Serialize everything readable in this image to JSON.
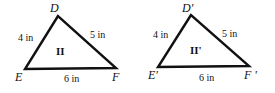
{
  "diagram": {
    "triangles": [
      {
        "id": "II",
        "label": "II",
        "vertices": {
          "D": "D",
          "E": "E",
          "F": "F"
        },
        "sides": {
          "DE": "4 in",
          "DF": "5 in",
          "EF": "6 in"
        }
      },
      {
        "id": "II'",
        "label": "II'",
        "vertices": {
          "D": "D'",
          "E": "E'",
          "F": "F '"
        },
        "sides": {
          "DE": "4 in",
          "DF": "5 in",
          "EF": "6 in"
        }
      }
    ],
    "stroke_color": "#111111"
  }
}
